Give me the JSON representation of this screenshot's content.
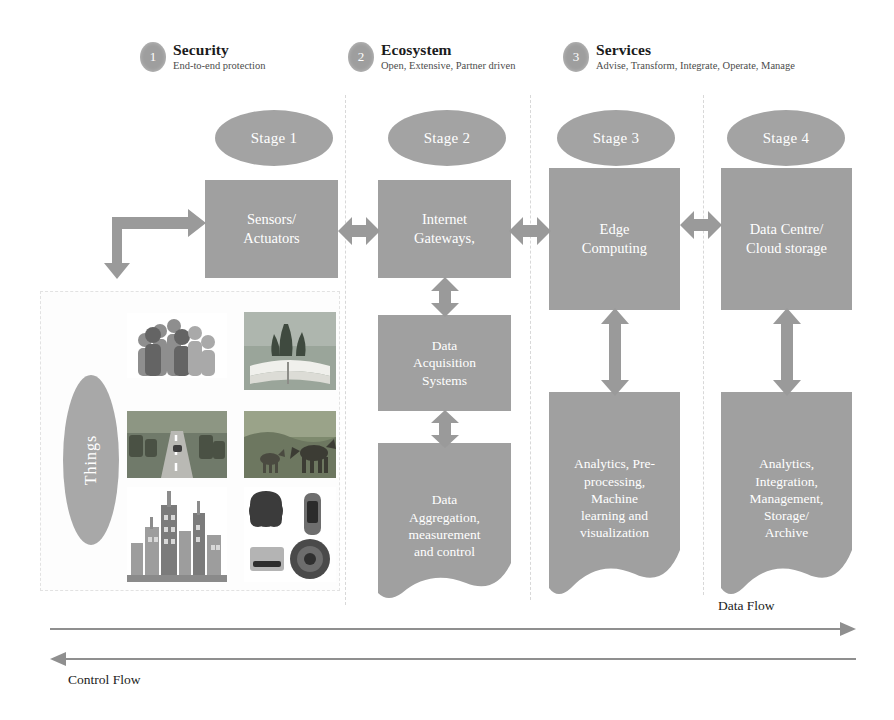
{
  "diagram": {
    "colors": {
      "box_fill": "#a0a0a0",
      "ellipse_fill": "#a3a3a3",
      "badge_fill": "#9e9e9e",
      "arrow_fill": "#9a9a9a",
      "box_text": "#ffffff",
      "heading_text": "#1b1b1b",
      "separator": "#d8d8d8",
      "page_background": "#ffffff"
    }
  },
  "pillars": [
    {
      "number": "1",
      "title": "Security",
      "subtitle": "End-to-end protection"
    },
    {
      "number": "2",
      "title": "Ecosystem",
      "subtitle": "Open, Extensive, Partner driven"
    },
    {
      "number": "3",
      "title": "Services",
      "subtitle": "Advise, Transform, Integrate, Operate, Manage"
    }
  ],
  "stages": [
    {
      "label": "Stage 1"
    },
    {
      "label": "Stage 2"
    },
    {
      "label": "Stage 3"
    },
    {
      "label": "Stage 4"
    }
  ],
  "boxes": {
    "sensors": {
      "label": "Sensors/\nActuators"
    },
    "gateways": {
      "label": "Internet\nGateways,"
    },
    "acquisition": {
      "label": "Data\nAcquisition\nSystems"
    },
    "aggregation": {
      "label": "Data\nAggregation,\nmeasurement\nand control"
    },
    "edge": {
      "label": "Edge\nComputing"
    },
    "edge_analytics": {
      "label": "Analytics, Pre-\nprocessing,\nMachine\nlearning and\nvisualization"
    },
    "datacentre": {
      "label": "Data Centre/\nCloud storage"
    },
    "cloud_analytics": {
      "label": "Analytics,\nIntegration,\nManagement,\nStorage/\nArchive"
    }
  },
  "things": {
    "label": "Things",
    "photos": [
      {
        "name": "people-group-photo",
        "caption": "people"
      },
      {
        "name": "open-book-tree-photo",
        "caption": "book and tree"
      },
      {
        "name": "road-traffic-photo",
        "caption": "road"
      },
      {
        "name": "animals-photo",
        "caption": "animals"
      },
      {
        "name": "city-skyline-photo",
        "caption": "city skyline"
      },
      {
        "name": "wearable-devices-photo",
        "caption": "wearable devices"
      }
    ]
  },
  "flows": {
    "data_flow": "Data Flow",
    "control_flow": "Control Flow"
  }
}
